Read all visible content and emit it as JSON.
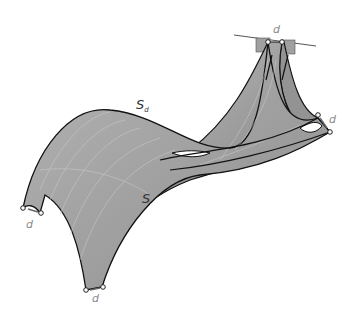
{
  "diagram": {
    "type": "shell-surface-offset",
    "labels": {
      "surface_offset": "S",
      "surface_offset_sub": "d",
      "surface_original": "S",
      "offset_distance": "d"
    },
    "support_points": [
      {
        "name": "top",
        "label": "d"
      },
      {
        "name": "right",
        "label": "d"
      },
      {
        "name": "left",
        "label": "d"
      },
      {
        "name": "bottom",
        "label": "d"
      }
    ],
    "colors": {
      "surface_fill_light": "#a8a8a8",
      "surface_fill_dark": "#8c8c8c",
      "surface_edge": "#111111",
      "grid_lines": "#cfcfcf",
      "label_gray": "#8a8a8a",
      "plate": "#a0a0a0"
    }
  }
}
